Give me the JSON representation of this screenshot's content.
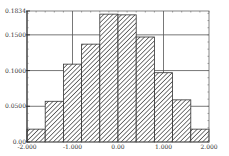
{
  "chart_data": {
    "type": "bar",
    "subtype": "histogram",
    "title": "",
    "xlabel": "",
    "ylabel": "",
    "bin_edges": [
      -2.0,
      -1.6,
      -1.2,
      -0.8,
      -0.4,
      0.0,
      0.4,
      0.8,
      1.2,
      1.6,
      2.0
    ],
    "categories": [
      "-2.0 to -1.6",
      "-1.6 to -1.2",
      "-1.2 to -0.8",
      "-0.8 to -0.4",
      "-0.4 to 0.0",
      "0.0 to 0.4",
      "0.4 to 0.8",
      "0.8 to 1.2",
      "1.2 to 1.6",
      "1.6 to 2.0"
    ],
    "values": [
      0.018,
      0.057,
      0.109,
      0.137,
      0.179,
      0.178,
      0.147,
      0.097,
      0.059,
      0.018
    ],
    "xlim": [
      -2.0,
      2.0
    ],
    "ylim": [
      0.0,
      0.1834
    ],
    "x_ticks": [
      {
        "value": -2.0,
        "label": "-2.000"
      },
      {
        "value": -1.0,
        "label": "-1.000"
      },
      {
        "value": 0.0,
        "label": "0.00"
      },
      {
        "value": 1.0,
        "label": "1.000"
      },
      {
        "value": 2.0,
        "label": "2.000"
      }
    ],
    "y_ticks": [
      {
        "value": 0.0,
        "label": "0.00"
      },
      {
        "value": 0.05,
        "label": "0.0500"
      },
      {
        "value": 0.1,
        "label": "0.1000"
      },
      {
        "value": 0.15,
        "label": "0.1500"
      },
      {
        "value": 0.1834,
        "label": "0.1834"
      }
    ],
    "grid": {
      "x": [
        -1.0,
        1.0
      ],
      "y": [
        0.05,
        0.1,
        0.15
      ]
    },
    "bar_fill": "diagonal-hatch",
    "colors": {
      "bar_stroke": "#333333",
      "hatch": "#333333",
      "grid": "#555555",
      "axis": "#666666",
      "background": "#ffffff"
    },
    "legend": null
  }
}
